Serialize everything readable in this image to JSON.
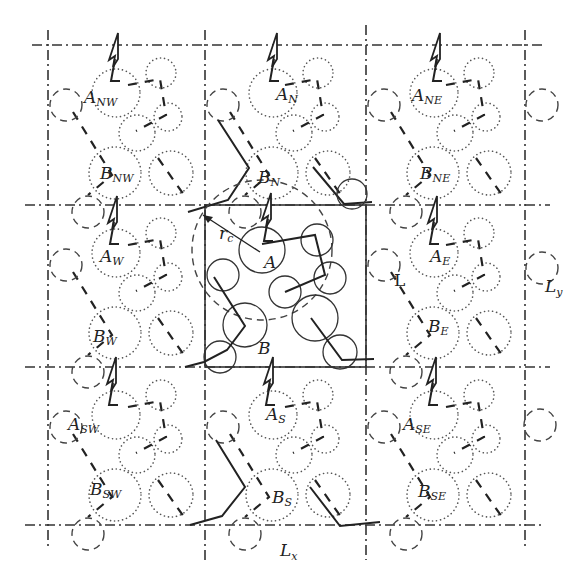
{
  "diagram": {
    "cell_dimensions": {
      "x_label": "L",
      "x_sub": "x",
      "y_label": "L",
      "y_sub": "y"
    },
    "cutoff_label": {
      "main": "r",
      "sub": "c"
    },
    "cell_label": "L",
    "central_cell": {
      "molecule_a": "A",
      "molecule_b": "B"
    },
    "images": [
      {
        "id": "NW",
        "a_main": "A",
        "a_sub": "NW",
        "b_main": "B",
        "b_sub": "NW"
      },
      {
        "id": "N",
        "a_main": "A",
        "a_sub": "N",
        "b_main": "B",
        "b_sub": "N"
      },
      {
        "id": "NE",
        "a_main": "A",
        "a_sub": "NE",
        "b_main": "B",
        "b_sub": "NE"
      },
      {
        "id": "W",
        "a_main": "A",
        "a_sub": "W",
        "b_main": "B",
        "b_sub": "W"
      },
      {
        "id": "E",
        "a_main": "A",
        "a_sub": "E",
        "b_main": "B",
        "b_sub": "E"
      },
      {
        "id": "SW",
        "a_main": "A",
        "a_sub": "SW",
        "b_main": "B",
        "b_sub": "SW"
      },
      {
        "id": "S",
        "a_main": "A",
        "a_sub": "S",
        "b_main": "B",
        "b_sub": "S"
      },
      {
        "id": "SE",
        "a_main": "A",
        "a_sub": "SE",
        "b_main": "B",
        "b_sub": "SE"
      }
    ],
    "colors": {
      "ink": "#222222",
      "background": "#ffffff"
    }
  }
}
